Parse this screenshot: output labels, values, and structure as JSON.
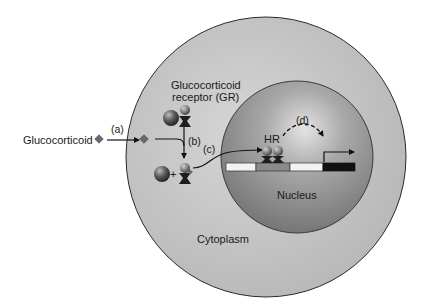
{
  "labels": {
    "glucocorticoid": "Glucocorticoid",
    "receptor_line1": "Glucocorticoid",
    "receptor_line2": "receptor (GR)",
    "hr": "HR",
    "nucleus": "Nucleus",
    "cytoplasm": "Cytoplasm"
  },
  "steps": {
    "a": "(a)",
    "b": "(b)",
    "c": "(c)",
    "d": "(d)"
  },
  "symbols": {
    "plus": "+"
  },
  "colors": {
    "cell": "#c2c2c2",
    "cell_stroke": "#2a2a2a",
    "nucleus": "#8c8c8c",
    "nucleus_highlight": "#dcdcdc",
    "dna_white": "#f2f2f2",
    "dna_gray": "#8a8a8a",
    "dna_black": "#111111",
    "hormone": "#6a6a6a"
  },
  "dna_segments": [
    {
      "name": "segment-1",
      "fill": "light"
    },
    {
      "name": "response-element",
      "fill": "gray"
    },
    {
      "name": "segment-3",
      "fill": "light"
    },
    {
      "name": "gene",
      "fill": "black"
    }
  ]
}
